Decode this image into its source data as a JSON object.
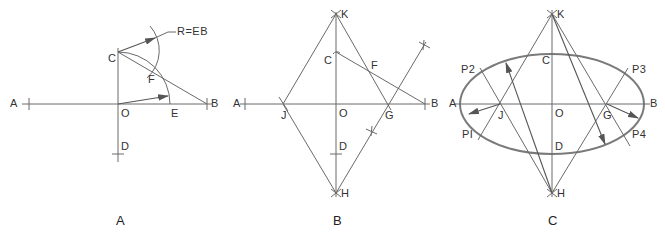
{
  "panels": [
    {
      "id": "A",
      "caption": "A",
      "labels": {
        "A": "A",
        "B": "B",
        "C": "C",
        "D": "D",
        "O": "O",
        "E": "E",
        "F": "F",
        "radius": "R=EB"
      }
    },
    {
      "id": "B",
      "caption": "B",
      "labels": {
        "A": "A",
        "B": "B",
        "C": "C",
        "D": "D",
        "O": "O",
        "F": "F",
        "J": "J",
        "G": "G",
        "K": "K",
        "H": "H"
      }
    },
    {
      "id": "C",
      "caption": "C",
      "labels": {
        "A": "A",
        "B": "B",
        "C": "C",
        "D": "D",
        "O": "O",
        "J": "J",
        "G": "G",
        "K": "K",
        "H": "H",
        "P1": "PI",
        "P2": "P2",
        "P3": "P3",
        "P4": "P4"
      }
    }
  ],
  "colors": {
    "line": "#6a6a6a",
    "ellipse": "#7a7a7a",
    "text": "#333333"
  }
}
